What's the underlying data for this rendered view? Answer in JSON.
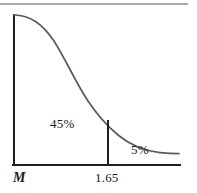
{
  "figure": {
    "background_color": "#ffffff"
  },
  "top_rule": {
    "name": "page-top-rule",
    "color": "#8c8c8c",
    "y": 4,
    "x_start": 0,
    "x_end": 188,
    "thickness": 1.4
  },
  "axes": {
    "color": "#1f1f1f",
    "thickness": 2,
    "vertical": {
      "x": 14,
      "y_top": 15,
      "y_bottom": 165
    },
    "horizontal": {
      "y": 165,
      "x_start": 13,
      "x_end": 180
    }
  },
  "curve": {
    "name": "normal-distribution-curve",
    "color": "#5a5a5a",
    "thickness": 1.7,
    "path": "M 14 15 C 30 15.5 42 23 54 41 C 66 60 76 83 88 101 C 98 116 106 125 118 135 C 130 145 146 151 160 152.6 C 168 153.4 174 153.6 179 153.6"
  },
  "divider": {
    "name": "cutoff-line-at-1.65",
    "color": "#1f1f1f",
    "thickness": 2,
    "x": 108,
    "y_top": 121,
    "y_bottom": 165
  },
  "labels": {
    "region_major": "45%",
    "region_minor": "5%",
    "axis_origin": "M",
    "axis_tick": "1.65"
  },
  "chart_data": {
    "type": "area",
    "title": "",
    "subtitle": "",
    "xlabel": "",
    "ylabel": "",
    "curve_description": "Right half of a normal (bell) density curve, decreasing from its peak at the mean M to an asymptotic tail on the right",
    "x_tick_labels": [
      "M",
      "1.65"
    ],
    "x_tick_positions": [
      0,
      1.65
    ],
    "grid": false,
    "legend": null,
    "annotations": [
      {
        "text": "45%",
        "meaning": "Area under the curve between M and 1.65",
        "value": 45,
        "unit": "percent",
        "region": "M to 1.65"
      },
      {
        "text": "5%",
        "meaning": "Area under the curve to the right of 1.65 (upper tail)",
        "value": 5,
        "unit": "percent",
        "region": "right of 1.65"
      }
    ],
    "series": [
      {
        "name": "normal density (right half)",
        "x": [
          0.0,
          0.25,
          0.5,
          0.75,
          1.0,
          1.25,
          1.5,
          1.65,
          1.9,
          2.25,
          2.6,
          3.0,
          3.4
        ],
        "y": [
          1.0,
          0.969,
          0.882,
          0.754,
          0.607,
          0.458,
          0.325,
          0.256,
          0.165,
          0.079,
          0.034,
          0.011,
          0.003
        ]
      }
    ],
    "xlim": [
      0,
      3.4
    ],
    "ylim": [
      0,
      1
    ]
  }
}
